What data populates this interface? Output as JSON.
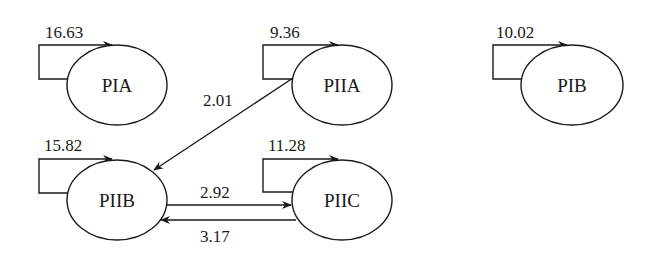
{
  "diagram": {
    "type": "state-transition",
    "nodes": [
      {
        "id": "PIA",
        "label": "PIA",
        "self_loop": "16.63"
      },
      {
        "id": "PIIA",
        "label": "PIIA",
        "self_loop": "9.36"
      },
      {
        "id": "PIB",
        "label": "PIB",
        "self_loop": "10.02"
      },
      {
        "id": "PIIB",
        "label": "PIIB",
        "self_loop": "15.82"
      },
      {
        "id": "PIIC",
        "label": "PIIC",
        "self_loop": "11.28"
      }
    ],
    "edges": [
      {
        "from": "PIIA",
        "to": "PIIB",
        "label": "2.01"
      },
      {
        "from": "PIIB",
        "to": "PIIC",
        "label": "2.92"
      },
      {
        "from": "PIIC",
        "to": "PIIB",
        "label": "3.17"
      }
    ]
  },
  "colors": {
    "line": "#1a1a1a",
    "background": "#ffffff"
  }
}
